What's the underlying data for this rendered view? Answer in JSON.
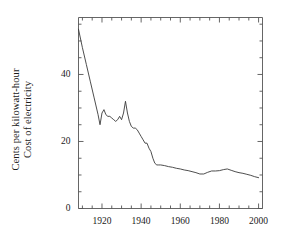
{
  "figure": {
    "background_color": "#ffffff",
    "line_color": "#3a3a3a",
    "axis_color": "#555555",
    "text_color": "#1a1a1a"
  },
  "axis_title": {
    "line1": "Cost of electricity",
    "line2": "Cents per kilowatt-hour"
  },
  "chart_data": {
    "type": "line",
    "title": "",
    "xlabel": "",
    "ylabel": "Cost of electricity Cents per kilowatt-hour",
    "xlim": [
      1908,
      2002
    ],
    "ylim": [
      0,
      57
    ],
    "grid": false,
    "legend": null,
    "xticks": [
      1920,
      1940,
      1960,
      1980,
      2000
    ],
    "xtick_labels": [
      "1920",
      "1940",
      "1960",
      "1980",
      "2000"
    ],
    "xminor_step": 5,
    "yticks": [
      0,
      20,
      40
    ],
    "ytick_labels": [
      "0",
      "20",
      "40"
    ],
    "yminor_step": 5,
    "series": [
      {
        "name": "Cost of electricity (cents per kWh)",
        "x": [
          1908,
          1910,
          1912,
          1914,
          1916,
          1918,
          1919,
          1920,
          1921,
          1922,
          1923,
          1924,
          1925,
          1926,
          1927,
          1928,
          1929,
          1930,
          1931,
          1932,
          1933,
          1934,
          1935,
          1936,
          1937,
          1938,
          1939,
          1940,
          1941,
          1942,
          1943,
          1944,
          1945,
          1946,
          1947,
          1948,
          1949,
          1950,
          1952,
          1954,
          1956,
          1958,
          1960,
          1962,
          1964,
          1966,
          1968,
          1970,
          1972,
          1974,
          1976,
          1978,
          1980,
          1982,
          1984,
          1986,
          1988,
          1990,
          1992,
          1994,
          1996,
          1998,
          2000
        ],
        "y": [
          53.5,
          48.0,
          43.0,
          38.0,
          33.0,
          28.0,
          25.0,
          28.5,
          29.5,
          28.0,
          27.5,
          27.5,
          27.0,
          26.5,
          26.0,
          26.5,
          27.5,
          26.5,
          28.5,
          32.0,
          28.5,
          26.0,
          24.5,
          24.0,
          24.0,
          23.5,
          22.5,
          21.5,
          20.5,
          19.5,
          19.5,
          18.0,
          17.0,
          15.0,
          13.5,
          13.0,
          13.0,
          13.0,
          12.8,
          12.5,
          12.3,
          12.0,
          11.8,
          11.5,
          11.3,
          11.0,
          10.7,
          10.3,
          10.3,
          10.8,
          11.2,
          11.2,
          11.3,
          11.6,
          11.8,
          11.4,
          11.0,
          10.7,
          10.5,
          10.2,
          9.9,
          9.5,
          9.2
        ]
      }
    ]
  }
}
